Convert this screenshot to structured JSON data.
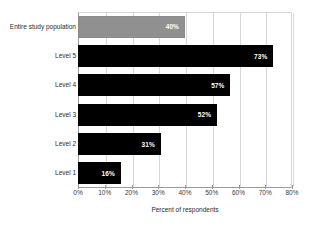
{
  "chart_data": {
    "type": "bar",
    "orientation": "horizontal",
    "title": "",
    "xlabel": "Percent of respondents",
    "ylabel": "",
    "xlim": [
      0,
      80
    ],
    "xticks": [
      "0%",
      "10%",
      "20%",
      "30%",
      "40%",
      "50%",
      "60%",
      "70%",
      "80%"
    ],
    "grid": true,
    "legend": "none",
    "categories": [
      "Entire study population",
      "Level 5",
      "Level 4",
      "Level 3",
      "Level 2",
      "Level 1"
    ],
    "values": [
      40,
      73,
      57,
      52,
      31,
      16
    ],
    "data_labels": [
      "40%",
      "73%",
      "57%",
      "52%",
      "31%",
      "16%"
    ],
    "bar_colors": [
      "#909090",
      "#000000",
      "#000000",
      "#000000",
      "#000000",
      "#000000"
    ]
  }
}
